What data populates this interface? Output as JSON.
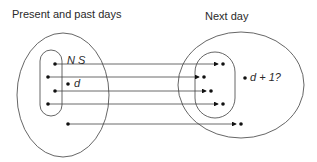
{
  "titles": {
    "left": "Present and past days",
    "right": "Next day"
  },
  "labels": {
    "set": "N S",
    "d": "d",
    "d_plus_1": "d + 1?"
  },
  "colors": {
    "stroke": "#555555",
    "dot": "#111111",
    "text": "#2a2a2a"
  },
  "arrows": [
    {
      "from": [
        55,
        64
      ],
      "to": [
        222,
        64
      ]
    },
    {
      "from": [
        48,
        77
      ],
      "to": [
        203,
        77
      ]
    },
    {
      "from": [
        55,
        91
      ],
      "to": [
        210,
        91
      ]
    },
    {
      "from": [
        48,
        104
      ],
      "to": [
        222,
        104
      ]
    },
    {
      "from": [
        68,
        124
      ],
      "to": [
        240,
        124
      ]
    }
  ]
}
